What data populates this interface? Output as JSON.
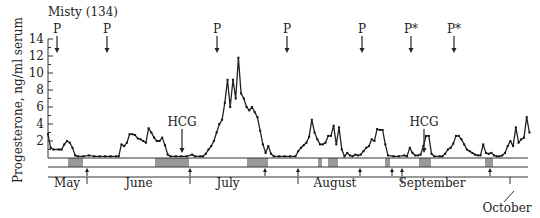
{
  "chart_data": {
    "type": "line",
    "title": "Misty (134)",
    "ylabel": "Progesterone, ng/ml serum",
    "xlabel": "",
    "ylim": [
      0,
      14
    ],
    "yticks": [
      2,
      4,
      6,
      8,
      10,
      12,
      14
    ],
    "months": [
      {
        "label": "May",
        "x": 67,
        "y": 187
      },
      {
        "label": "June",
        "x": 139,
        "y": 187
      },
      {
        "label": "July",
        "x": 228,
        "y": 187
      },
      {
        "label": "August",
        "x": 335,
        "y": 187
      },
      {
        "label": "September",
        "x": 432,
        "y": 187
      },
      {
        "label": "October",
        "x": 507,
        "y": 212
      }
    ],
    "month_ticks_px": [
      87,
      190,
      298,
      402,
      510
    ],
    "x_unit": "approx. day index from start of record (3.4 px/day)",
    "series": [
      {
        "name": "Progesterone",
        "points": [
          [
            0,
            2.8
          ],
          [
            1,
            1.2
          ],
          [
            2,
            1.0
          ],
          [
            4,
            1.0
          ],
          [
            5,
            1.0
          ],
          [
            6,
            1.6
          ],
          [
            7,
            2.0
          ],
          [
            8,
            1.8
          ],
          [
            9,
            1.2
          ],
          [
            10,
            0.3
          ],
          [
            11,
            0.2
          ],
          [
            13,
            0.2
          ],
          [
            15,
            0.3
          ],
          [
            17,
            0.2
          ],
          [
            19,
            0.2
          ],
          [
            21,
            0.2
          ],
          [
            23,
            0.2
          ],
          [
            25,
            0.2
          ],
          [
            26,
            0.2
          ],
          [
            27,
            1.6
          ],
          [
            28,
            1.4
          ],
          [
            29,
            1.8
          ],
          [
            30,
            2.8
          ],
          [
            31,
            2.8
          ],
          [
            32,
            2.7
          ],
          [
            33,
            2.3
          ],
          [
            34,
            2.2
          ],
          [
            35,
            2.0
          ],
          [
            36,
            1.8
          ],
          [
            37,
            3.5
          ],
          [
            38,
            3.0
          ],
          [
            39,
            2.4
          ],
          [
            40,
            2.0
          ],
          [
            41,
            2.0
          ],
          [
            42,
            2.4
          ],
          [
            43,
            1.5
          ],
          [
            44,
            0.4
          ],
          [
            45,
            0.2
          ],
          [
            47,
            0.2
          ],
          [
            49,
            0.2
          ],
          [
            51,
            0.2
          ],
          [
            53,
            0.4
          ],
          [
            54,
            0.2
          ],
          [
            56,
            0.2
          ],
          [
            57,
            0.2
          ],
          [
            58,
            0.5
          ],
          [
            59,
            1.0
          ],
          [
            60,
            1.4
          ],
          [
            61,
            2.0
          ],
          [
            62,
            3.0
          ],
          [
            63,
            4.0
          ],
          [
            64,
            4.5
          ],
          [
            65,
            6.5
          ],
          [
            66,
            9.2
          ],
          [
            67,
            6.0
          ],
          [
            68,
            9.2
          ],
          [
            69,
            7.0
          ],
          [
            70,
            11.8
          ],
          [
            71,
            7.6
          ],
          [
            72,
            7.0
          ],
          [
            73,
            6.0
          ],
          [
            74,
            5.6
          ],
          [
            75,
            6.0
          ],
          [
            76,
            5.4
          ],
          [
            77,
            4.8
          ],
          [
            78,
            3.2
          ],
          [
            79,
            1.6
          ],
          [
            80,
            0.6
          ],
          [
            81,
            1.4
          ],
          [
            82,
            0.5
          ],
          [
            83,
            0.2
          ],
          [
            85,
            0.2
          ],
          [
            87,
            0.2
          ],
          [
            89,
            0.2
          ],
          [
            91,
            0.2
          ],
          [
            92,
            0.8
          ],
          [
            93,
            1.2
          ],
          [
            94,
            1.5
          ],
          [
            95,
            1.8
          ],
          [
            96,
            2.5
          ],
          [
            97,
            4.5
          ],
          [
            98,
            3.0
          ],
          [
            99,
            2.2
          ],
          [
            100,
            1.6
          ],
          [
            101,
            1.6
          ],
          [
            102,
            1.8
          ],
          [
            103,
            2.6
          ],
          [
            104,
            2.6
          ],
          [
            105,
            3.8
          ],
          [
            106,
            1.6
          ],
          [
            107,
            3.6
          ],
          [
            108,
            1.0
          ],
          [
            109,
            0.2
          ],
          [
            110,
            0.6
          ],
          [
            111,
            0.3
          ],
          [
            112,
            0.2
          ],
          [
            113,
            0.4
          ],
          [
            114,
            0.3
          ],
          [
            115,
            0.4
          ],
          [
            116,
            0.8
          ],
          [
            117,
            1.2
          ],
          [
            118,
            1.4
          ],
          [
            119,
            2.2
          ],
          [
            120,
            2.0
          ],
          [
            121,
            3.4
          ],
          [
            122,
            3.3
          ],
          [
            123,
            3.3
          ],
          [
            124,
            1.6
          ],
          [
            125,
            0.3
          ],
          [
            127,
            0.2
          ],
          [
            129,
            0.2
          ],
          [
            131,
            0.3
          ],
          [
            132,
            0.2
          ],
          [
            133,
            1.2
          ],
          [
            134,
            0.6
          ],
          [
            135,
            0.3
          ],
          [
            136,
            0.3
          ],
          [
            137,
            0.4
          ],
          [
            138,
            1.4
          ],
          [
            139,
            2.6
          ],
          [
            140,
            2.6
          ],
          [
            141,
            0.5
          ],
          [
            142,
            0.2
          ],
          [
            144,
            0.2
          ],
          [
            145,
            0.2
          ],
          [
            146,
            0.5
          ],
          [
            147,
            1.0
          ],
          [
            148,
            1.2
          ],
          [
            149,
            1.7
          ],
          [
            150,
            2.6
          ],
          [
            151,
            2.6
          ],
          [
            152,
            2.2
          ],
          [
            153,
            1.6
          ],
          [
            154,
            1.0
          ],
          [
            155,
            0.8
          ],
          [
            156,
            0.6
          ],
          [
            157,
            0.4
          ],
          [
            158,
            0.3
          ],
          [
            159,
            0.3
          ],
          [
            160,
            1.6
          ],
          [
            161,
            0.6
          ],
          [
            162,
            0.5
          ],
          [
            163,
            0.6
          ],
          [
            164,
            0.3
          ],
          [
            165,
            0.2
          ],
          [
            166,
            0.2
          ],
          [
            167,
            0.3
          ],
          [
            168,
            0.6
          ],
          [
            169,
            1.4
          ],
          [
            170,
            2.0
          ],
          [
            171,
            1.4
          ],
          [
            172,
            3.6
          ],
          [
            173,
            1.8
          ],
          [
            174,
            2.2
          ],
          [
            175,
            2.4
          ],
          [
            176,
            4.8
          ],
          [
            177,
            3.0
          ]
        ]
      }
    ],
    "annotations": [
      {
        "label": "P",
        "x_px": 57,
        "arrow_tip_y": 53
      },
      {
        "label": "P",
        "x_px": 107,
        "arrow_tip_y": 53
      },
      {
        "label": "P",
        "x_px": 217,
        "arrow_tip_y": 53
      },
      {
        "label": "P",
        "x_px": 287,
        "arrow_tip_y": 53
      },
      {
        "label": "P",
        "x_px": 362,
        "arrow_tip_y": 53
      },
      {
        "label": "P*",
        "x_px": 411,
        "arrow_tip_y": 53
      },
      {
        "label": "P*",
        "x_px": 454,
        "arrow_tip_y": 53
      },
      {
        "label": "HCG",
        "x_px": 182,
        "text_y": 126,
        "arrow_tip_y": 153
      },
      {
        "label": "HCG",
        "x_px": 424,
        "text_y": 126,
        "arrow_tip_y": 153
      }
    ],
    "shaded_periods_px": [
      [
        68,
        83
      ],
      [
        155,
        189
      ],
      [
        247,
        268
      ],
      [
        318,
        322
      ],
      [
        328,
        338
      ],
      [
        385,
        390
      ],
      [
        419,
        431
      ],
      [
        485,
        493
      ]
    ],
    "lower_arrows_px": [
      87,
      190,
      265,
      298,
      360,
      392,
      402,
      490
    ]
  }
}
